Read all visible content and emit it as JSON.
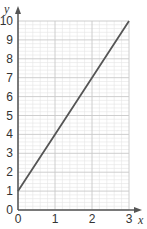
{
  "chart_data": {
    "type": "line",
    "title": "",
    "xlabel": "x",
    "ylabel": "y",
    "xlim": [
      0,
      3
    ],
    "ylim": [
      0,
      10
    ],
    "x_ticks": [
      "0",
      "1",
      "2",
      "3"
    ],
    "y_ticks": [
      "0",
      "1",
      "2",
      "3",
      "4",
      "5",
      "6",
      "7",
      "8",
      "9",
      "10"
    ],
    "grid": true,
    "grid_minor_step": 0.2,
    "legend": null,
    "series": [
      {
        "name": "y = 3x + 1",
        "x": [
          0,
          1,
          2,
          3
        ],
        "y": [
          1,
          4,
          7,
          10
        ],
        "color": "#555555"
      }
    ]
  },
  "colors": {
    "line": "#555555",
    "axis": "#555555",
    "grid_major": "#c8c8c8",
    "grid_minor": "#e4e4e4"
  }
}
